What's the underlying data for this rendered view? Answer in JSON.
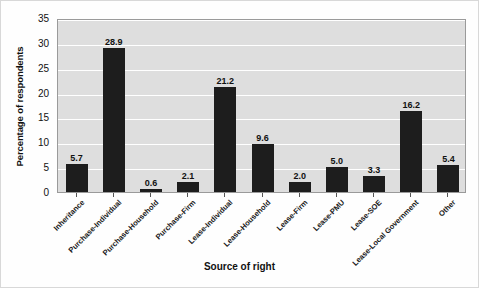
{
  "chart_data": {
    "type": "bar",
    "title": "",
    "xlabel": "Source of right",
    "ylabel": "Percentage of respondents",
    "categories": [
      "Inheritance",
      "Purchase-Individual",
      "Purchase-Household",
      "Purchase-Firm",
      "Lease-Individual",
      "Lease-Household",
      "Lease-Firm",
      "Lease-PMU",
      "Lease-SOE",
      "Lease-Local Government",
      "Other"
    ],
    "values": [
      5.7,
      28.9,
      0.6,
      2.1,
      21.2,
      9.6,
      2.0,
      5.0,
      3.3,
      16.2,
      5.4
    ],
    "value_labels": [
      "5.7",
      "28.9",
      "0.6",
      "2.1",
      "21.2",
      "9.6",
      "2.0",
      "5.0",
      "3.3",
      "16.2",
      "5.4"
    ],
    "ylim": [
      0,
      35
    ],
    "yticks": [
      0,
      5,
      10,
      15,
      20,
      25,
      30,
      35
    ],
    "ytick_labels": [
      "0",
      "5",
      "10",
      "15",
      "20",
      "25",
      "30",
      "35"
    ],
    "grid": "horizontal",
    "legend": "none",
    "colors": {
      "bar": "#1d1d1d",
      "plot_background": "#dedede",
      "gridline": "#ffffff",
      "plot_border": "#9a9a9a",
      "figure_background": "#fefefe",
      "text": "#111111"
    }
  },
  "axes": {
    "y_title": "Percentage of respondents",
    "x_title": "Source of right"
  }
}
